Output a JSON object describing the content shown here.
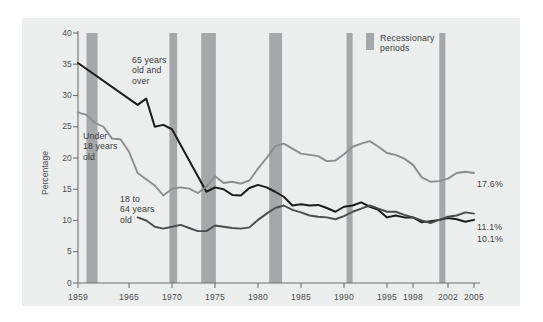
{
  "chart_data": {
    "type": "line",
    "title": "",
    "xlabel": "",
    "ylabel": "Percentage",
    "ylim": [
      0,
      40
    ],
    "ytick_values": [
      0,
      5,
      10,
      15,
      20,
      25,
      30,
      35,
      40
    ],
    "ytick_labels": [
      "0",
      "5",
      "10",
      "15",
      "20",
      "25",
      "30",
      "35",
      "40"
    ],
    "xlim": [
      1959,
      2005
    ],
    "xtick_labels": [
      "1959",
      "1965",
      "1970",
      "1975",
      "1980",
      "1985",
      "1990",
      "1995",
      "1998",
      "2002",
      "2005"
    ],
    "xtick_values": [
      1959,
      1965,
      1970,
      1975,
      1980,
      1985,
      1990,
      1995,
      1998,
      2002,
      2005
    ],
    "grid": false,
    "legend_position": "top-right",
    "series": [
      {
        "name": "65 years old and over",
        "color": "#1c1c1c",
        "label_text": "65 years\nold and\nover",
        "end_label": "10.1%",
        "x": [
          1959,
          1966,
          1967,
          1968,
          1969,
          1970,
          1974,
          1975,
          1976,
          1977,
          1978,
          1979,
          1980,
          1981,
          1982,
          1983,
          1984,
          1985,
          1986,
          1987,
          1988,
          1989,
          1990,
          1991,
          1992,
          1993,
          1994,
          1995,
          1996,
          1997,
          1998,
          1999,
          2000,
          2001,
          2002,
          2003,
          2004,
          2005
        ],
        "values": [
          35.2,
          28.5,
          29.5,
          25.0,
          25.3,
          24.6,
          14.6,
          15.3,
          15.0,
          14.1,
          14.0,
          15.2,
          15.7,
          15.3,
          14.6,
          13.8,
          12.4,
          12.6,
          12.4,
          12.5,
          12.0,
          11.4,
          12.2,
          12.4,
          12.9,
          12.2,
          11.7,
          10.5,
          10.8,
          10.5,
          10.5,
          9.7,
          9.9,
          10.1,
          10.4,
          10.2,
          9.8,
          10.1
        ]
      },
      {
        "name": "Under 18 years old",
        "color": "#8a8c8e",
        "label_text": "Under\n18 years\nold",
        "end_label": "17.6%",
        "x": [
          1959,
          1960,
          1961,
          1962,
          1963,
          1964,
          1965,
          1966,
          1967,
          1968,
          1969,
          1970,
          1971,
          1972,
          1973,
          1974,
          1975,
          1976,
          1977,
          1978,
          1979,
          1980,
          1981,
          1982,
          1983,
          1984,
          1985,
          1986,
          1987,
          1988,
          1989,
          1990,
          1991,
          1992,
          1993,
          1994,
          1995,
          1996,
          1997,
          1998,
          1999,
          2000,
          2001,
          2002,
          2003,
          2004,
          2005
        ],
        "values": [
          27.3,
          26.9,
          25.6,
          25.0,
          23.1,
          23.0,
          21.0,
          17.6,
          16.6,
          15.6,
          14.0,
          15.1,
          15.3,
          15.1,
          14.4,
          15.4,
          17.1,
          16.0,
          16.2,
          15.9,
          16.4,
          18.3,
          20.0,
          21.9,
          22.3,
          21.5,
          20.7,
          20.5,
          20.3,
          19.5,
          19.6,
          20.6,
          21.8,
          22.3,
          22.7,
          21.8,
          20.8,
          20.5,
          19.9,
          18.9,
          16.9,
          16.2,
          16.3,
          16.7,
          17.6,
          17.8,
          17.6
        ]
      },
      {
        "name": "18 to 64 years old",
        "color": "#4a4c4e",
        "label_text": "18 to\n64 years\nold",
        "end_label": "11.1%",
        "x": [
          1966,
          1967,
          1968,
          1969,
          1970,
          1971,
          1972,
          1973,
          1974,
          1975,
          1976,
          1977,
          1978,
          1979,
          1980,
          1981,
          1982,
          1983,
          1984,
          1985,
          1986,
          1987,
          1988,
          1989,
          1990,
          1991,
          1992,
          1993,
          1994,
          1995,
          1996,
          1997,
          1998,
          1999,
          2000,
          2001,
          2002,
          2003,
          2004,
          2005
        ],
        "values": [
          10.5,
          10.0,
          9.0,
          8.7,
          9.0,
          9.3,
          8.8,
          8.3,
          8.3,
          9.2,
          9.0,
          8.8,
          8.7,
          8.9,
          10.1,
          11.1,
          12.0,
          12.4,
          11.7,
          11.3,
          10.8,
          10.6,
          10.5,
          10.2,
          10.7,
          11.4,
          11.9,
          12.4,
          11.9,
          11.4,
          11.4,
          10.9,
          10.5,
          10.0,
          9.6,
          10.1,
          10.6,
          10.8,
          11.3,
          11.1
        ]
      }
    ],
    "recession_bands": [
      {
        "label": "1960-1961",
        "start": 1960.0,
        "end": 1961.3
      },
      {
        "label": "1969-1970",
        "start": 1969.7,
        "end": 1970.6
      },
      {
        "label": "1973-1975",
        "start": 1973.4,
        "end": 1975.1
      },
      {
        "label": "1980-1982",
        "start": 1981.3,
        "end": 1982.8
      },
      {
        "label": "1990-1991",
        "start": 1990.3,
        "end": 1991.0
      },
      {
        "label": "2001",
        "start": 2001.0,
        "end": 2001.7
      }
    ],
    "band_color": "#a5a7a9",
    "panel_color": "#eceded",
    "legend": {
      "swatch_color": "#a5a7a9",
      "text": "Recessionary\nperiods"
    }
  }
}
